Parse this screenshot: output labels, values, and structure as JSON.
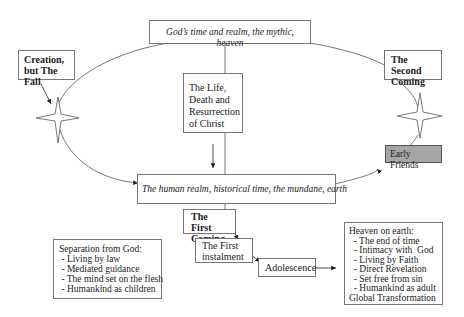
{
  "nodes": {
    "heaven": "God’s time and realm, the mythic, heaven",
    "creation": [
      "Creation,",
      "but The Fall"
    ],
    "christ": [
      "The Life,",
      "Death and",
      "Resurrection",
      "of Christ"
    ],
    "second_coming": [
      "The Second",
      "Coming"
    ],
    "early_friends": "Early Friends",
    "earth": "The human realm, historical time, the mundane, earth",
    "first_coming": [
      "The First",
      "Coming"
    ],
    "first_instalment": [
      "The First",
      "instalment"
    ],
    "adolescence": "Adolescence",
    "separation": {
      "title": "Separation from God:",
      "items": [
        " - Living by law",
        " - Mediated guidance",
        " - The mind set on the flesh",
        " - Humankind as children"
      ]
    },
    "heaven_on_earth": {
      "title": "Heaven on earth:",
      "items": [
        "  - The end of time",
        "  - Intimacy with  God",
        "  - Living by Faith",
        "  - Direct Revelation",
        "  - Set free from sin",
        "  - Humankind as adult"
      ],
      "footer": "Global Transformation"
    }
  },
  "colors": {
    "line": "#555555",
    "highlight": "#a6a6a6"
  }
}
